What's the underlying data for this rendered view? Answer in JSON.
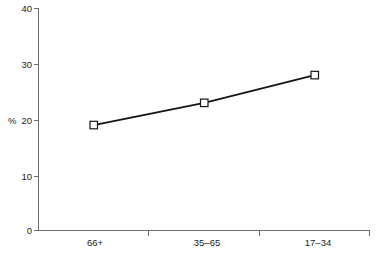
{
  "chart_data": {
    "type": "line",
    "title": "",
    "subtitle": "",
    "xlabel": "",
    "ylabel": "%",
    "categories": [
      "66+",
      "35–65",
      "17–34"
    ],
    "values": [
      19,
      23,
      28
    ],
    "series": [
      {
        "name": "",
        "values": [
          19,
          23,
          28
        ]
      }
    ],
    "ylim": [
      0,
      40
    ],
    "yticks": [
      0,
      10,
      20,
      30,
      40
    ],
    "ytick_labels": [
      "0",
      "10",
      "20",
      "30",
      "40"
    ],
    "grid": false,
    "legend": false,
    "legend_position": "none",
    "marker": "open-square",
    "line_color": "#141414",
    "marker_face_color": "#ffffff",
    "axis_color": "#6e6e6e",
    "background_color": "#ffffff"
  },
  "axes": {
    "y_axis_title": "%",
    "y_tick_0": "0",
    "y_tick_1": "10",
    "y_tick_2": "20",
    "y_tick_3": "30",
    "y_tick_4": "40",
    "x_cat_0": "66+",
    "x_cat_1": "35–65",
    "x_cat_2": "17–34"
  }
}
